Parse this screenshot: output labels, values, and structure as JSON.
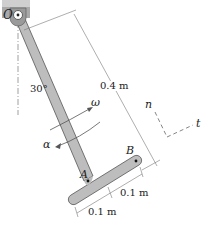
{
  "figure": {
    "pivot_label": "O",
    "angle_label": "30°",
    "omega_label": "ω",
    "alpha_label": "α",
    "length_label": "0.4 m",
    "point_a_label": "A",
    "point_b_label": "B",
    "half_bar_right_label": "0.1 m",
    "half_bar_left_label": "0.1 m",
    "normal_axis_label": "n",
    "tangent_axis_label": "t"
  },
  "colors": {
    "rod_fill": "#bdbdbd",
    "rod_stroke": "#555555",
    "ground_fill": "#a9a9a9",
    "line": "#777777"
  }
}
